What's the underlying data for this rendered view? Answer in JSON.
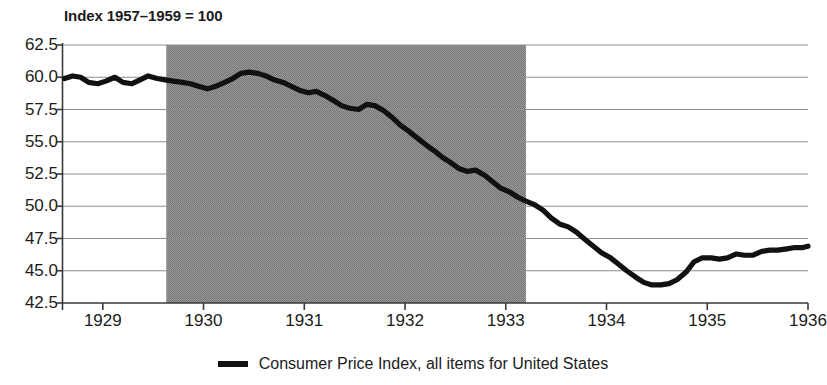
{
  "chart_data": {
    "type": "line",
    "title": "Index 1957–1959 = 100",
    "xlabel": "",
    "ylabel": "",
    "ylim": [
      42.5,
      62.5
    ],
    "xlim": [
      1928.6,
      1936.0
    ],
    "grid": true,
    "legend_position": "bottom",
    "yticks": [
      "62.5",
      "60.0",
      "57.5",
      "55.0",
      "52.5",
      "50.0",
      "47.5",
      "45.0",
      "42.5"
    ],
    "ytick_values": [
      62.5,
      60.0,
      57.5,
      55.0,
      52.5,
      50.0,
      47.5,
      45.0,
      42.5
    ],
    "xticks": [
      "1929",
      "1930",
      "1931",
      "1932",
      "1933",
      "1934",
      "1935",
      "1936"
    ],
    "xtick_values": [
      1929,
      1930,
      1931,
      1932,
      1933,
      1934,
      1935,
      1936
    ],
    "series": [
      {
        "name": "Consumer Price Index, all items for United States",
        "color": "#111111",
        "x": [
          1928.62,
          1928.7,
          1928.78,
          1928.86,
          1928.95,
          1929.03,
          1929.12,
          1929.2,
          1929.29,
          1929.37,
          1929.45,
          1929.54,
          1929.62,
          1929.7,
          1929.79,
          1929.87,
          1929.95,
          1930.04,
          1930.12,
          1930.21,
          1930.29,
          1930.37,
          1930.45,
          1930.54,
          1930.62,
          1930.7,
          1930.79,
          1930.87,
          1930.95,
          1931.04,
          1931.12,
          1931.2,
          1931.29,
          1931.37,
          1931.45,
          1931.54,
          1931.62,
          1931.7,
          1931.79,
          1931.87,
          1931.95,
          1932.04,
          1932.12,
          1932.2,
          1932.29,
          1932.37,
          1932.45,
          1932.54,
          1932.62,
          1932.7,
          1932.79,
          1932.87,
          1932.95,
          1933.04,
          1933.12,
          1933.2,
          1933.29,
          1933.37,
          1933.45,
          1933.54,
          1933.62,
          1933.7,
          1933.79,
          1933.87,
          1933.95,
          1934.04,
          1934.12,
          1934.2,
          1934.29,
          1934.37,
          1934.45,
          1934.54,
          1934.62,
          1934.7,
          1934.79,
          1934.87,
          1934.95,
          1935.04,
          1935.12,
          1935.2,
          1935.29,
          1935.37,
          1935.45,
          1935.54,
          1935.62,
          1935.7,
          1935.79,
          1935.87,
          1935.95,
          1936.0
        ],
        "y": [
          59.9,
          60.1,
          60.0,
          59.6,
          59.5,
          59.7,
          60.0,
          59.6,
          59.5,
          59.8,
          60.1,
          59.9,
          59.8,
          59.7,
          59.6,
          59.5,
          59.3,
          59.1,
          59.3,
          59.6,
          59.9,
          60.3,
          60.4,
          60.3,
          60.1,
          59.8,
          59.6,
          59.3,
          59.0,
          58.8,
          58.9,
          58.6,
          58.2,
          57.8,
          57.6,
          57.5,
          57.9,
          57.8,
          57.4,
          56.9,
          56.3,
          55.8,
          55.3,
          54.8,
          54.3,
          53.8,
          53.4,
          52.9,
          52.7,
          52.8,
          52.4,
          51.9,
          51.4,
          51.1,
          50.7,
          50.4,
          50.1,
          49.7,
          49.1,
          48.6,
          48.4,
          48.0,
          47.4,
          46.9,
          46.4,
          46.0,
          45.5,
          45.0,
          44.5,
          44.1,
          43.9,
          43.9,
          44.0,
          44.3,
          44.9,
          45.7,
          46.0,
          46.0,
          45.9,
          46.0,
          46.3,
          46.2,
          46.2,
          46.5,
          46.6,
          46.6,
          46.7,
          46.8,
          46.8,
          46.9
        ]
      }
    ],
    "shaded_region": {
      "label": "recession-band",
      "x_start": 1929.63,
      "x_end": 1933.2,
      "color": "#8c8c8c"
    }
  },
  "legend": {
    "swatch_name": "line-swatch",
    "label": "Consumer Price Index, all items for United States"
  }
}
